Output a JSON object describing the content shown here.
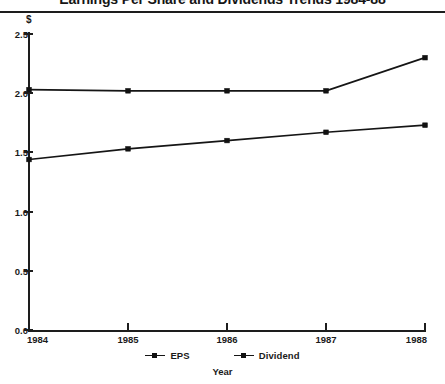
{
  "chart_data": {
    "type": "line",
    "title": "Earnings Per Share and Dividends Trends 1984-88",
    "xlabel": "Year",
    "ylabel": "$",
    "categories": [
      "1984",
      "1985",
      "1986",
      "1987",
      "1988"
    ],
    "series": [
      {
        "name": "EPS",
        "values": [
          2.03,
          2.02,
          2.02,
          2.02,
          2.3
        ]
      },
      {
        "name": "Dividend",
        "values": [
          1.44,
          1.53,
          1.6,
          1.67,
          1.73
        ]
      }
    ],
    "ylim": [
      0.0,
      2.5
    ],
    "ytick_labels": [
      "0.0",
      "0.5",
      "1.0",
      "1.5",
      "2.0",
      "2.5"
    ],
    "ytick_values": [
      0.0,
      0.5,
      1.0,
      1.5,
      2.0,
      2.5
    ],
    "grid": false,
    "legend_position": "bottom",
    "legend_entries": [
      "EPS",
      "Dividend"
    ],
    "marker": "square",
    "line_color": "#151515",
    "axis_color": "#1d1d1d",
    "background": "#ffffff"
  }
}
